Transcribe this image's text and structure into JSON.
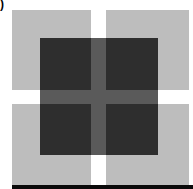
{
  "figure": {
    "panel_label": ")",
    "colors": {
      "background": "#ffffff",
      "light_square": "#bdbdbd",
      "dark_square": "#2e2e2e",
      "cross_overlap": "#5a5a5a",
      "bottom_bar": "#0a0a0a"
    },
    "light_squares": [
      "top-left",
      "top-right",
      "bottom-left",
      "bottom-right"
    ],
    "dark_square": "center overlay"
  }
}
